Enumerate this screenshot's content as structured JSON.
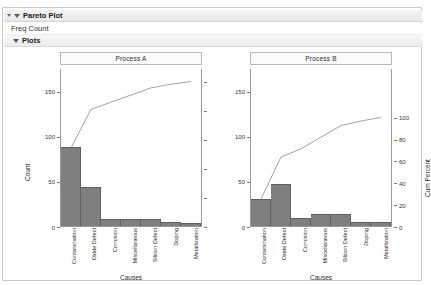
{
  "window": {
    "outline": [
      {
        "label": "Pareto Plot",
        "icon": "disclosure-triangle-open",
        "level": 0
      },
      {
        "label": "Freq Count",
        "icon": "none",
        "level": 1
      },
      {
        "label": "Plots",
        "icon": "disclosure-triangle-open",
        "level": 2
      }
    ]
  },
  "colors": {
    "bar_fill": "#7f7f7f",
    "bar_stroke": "#5f5f5f",
    "line": "#555555",
    "axis": "#9a9a9a",
    "panel_header_bg": "#fbfbfb"
  },
  "chart_data": [
    {
      "type": "bar",
      "title": "Process A",
      "xlabel": "Causes",
      "ylabel": "Count",
      "y2label": "Cum Percent",
      "categories": [
        "Contamination",
        "Oxide Defect",
        "Corrosion",
        "Miscellaneous",
        "Silicon Defect",
        "Doping",
        "Metallization"
      ],
      "values": [
        87,
        43,
        8,
        8,
        8,
        4,
        3
      ],
      "cum_percent": [
        55.4,
        82.8,
        87.9,
        93.0,
        98.1,
        100.6,
        102.5
      ],
      "cum_counts": [
        87,
        130,
        138,
        146,
        154,
        158,
        161
      ],
      "ylim": [
        0,
        175
      ],
      "yticks": [
        0,
        50,
        100,
        150
      ],
      "y2lim": [
        0,
        110
      ],
      "y2ticks": [
        0,
        20,
        40,
        60,
        80,
        100
      ],
      "grid": false,
      "legend": "none"
    },
    {
      "type": "bar",
      "title": "Process B",
      "xlabel": "Causes",
      "ylabel": "Count",
      "y2label": "Cum Percent",
      "categories": [
        "Contamination",
        "Oxide Defect",
        "Corrosion",
        "Miscellaneous",
        "Silicon Defect",
        "Doping",
        "Metallization"
      ],
      "values": [
        30,
        47,
        9,
        13,
        13,
        5,
        4
      ],
      "cum_percent": [
        24.0,
        61.6,
        68.8,
        79.2,
        89.6,
        93.6,
        96.8
      ],
      "cum_counts": [
        30,
        77,
        86,
        99,
        112,
        117,
        121
      ],
      "ylim": [
        0,
        175
      ],
      "yticks": [
        0,
        50,
        100,
        150
      ],
      "y2lim": [
        0,
        110
      ],
      "y2ticks": [
        0,
        20,
        40,
        60,
        80,
        100
      ],
      "grid": false,
      "legend": "none"
    }
  ]
}
